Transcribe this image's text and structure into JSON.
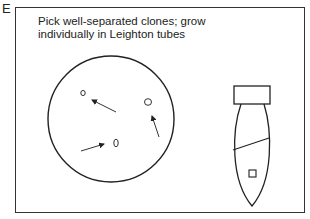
{
  "panel": {
    "letter": "E",
    "caption_line1": "Pick well-separated clones; grow",
    "caption_line2": "individually in Leighton tubes"
  },
  "figure": {
    "plate": {
      "label": "petri-dish",
      "colonies": 3,
      "arrows": 3
    },
    "tube": {
      "label": "leighton-tube",
      "has_coverslip": true
    }
  },
  "colors": {
    "stroke": "#222222",
    "background": "#ffffff"
  }
}
